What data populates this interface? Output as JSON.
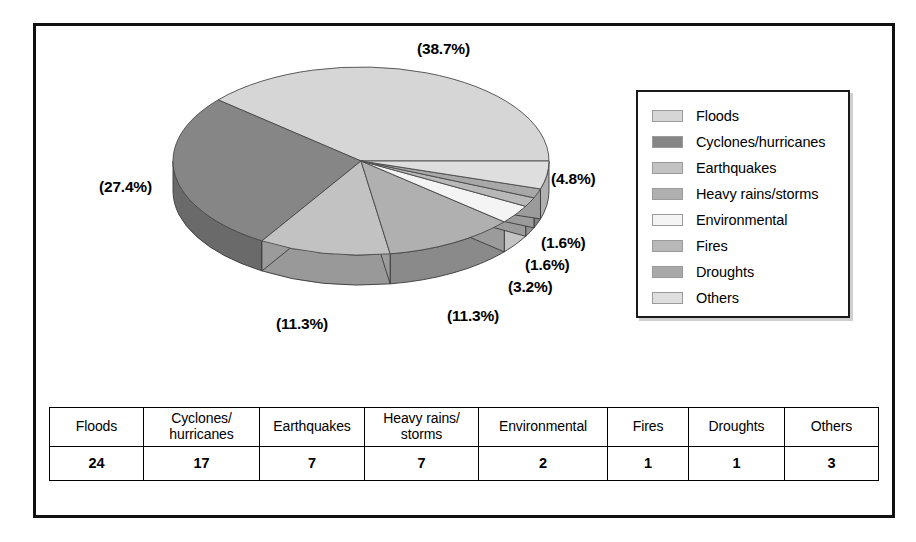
{
  "chart_data": {
    "type": "pie",
    "title": "",
    "subtitle": "",
    "xlabel": "",
    "ylabel": "",
    "legend_position": "right",
    "grid": false,
    "three_d": true,
    "total": 62,
    "categories": [
      "Floods",
      "Cyclones/hurricanes",
      "Earthquakes",
      "Heavy rains/storms",
      "Environmental",
      "Fires",
      "Droughts",
      "Others"
    ],
    "values": [
      24,
      17,
      7,
      7,
      2,
      1,
      1,
      3
    ],
    "percentages": [
      38.7,
      27.4,
      11.3,
      11.3,
      3.2,
      1.6,
      1.6,
      4.8
    ],
    "percent_labels": [
      "(38.7%)",
      "(27.4%)",
      "(11.3%)",
      "(11.3%)",
      "(3.2%)",
      "(1.6%)",
      "(1.6%)",
      "(4.8%)"
    ],
    "colors": [
      "#d6d6d6",
      "#868686",
      "#c2c2c2",
      "#b0b0b0",
      "#f4f4f4",
      "#b8b8b8",
      "#a8a8a8",
      "#dedede"
    ],
    "side_colors": [
      "#a8a8a8",
      "#6a6a6a",
      "#999999",
      "#8a8a8a",
      "#c4c4c4",
      "#909090",
      "#828282",
      "#b0b0b0"
    ]
  },
  "legend": {
    "items": [
      {
        "label": "Floods"
      },
      {
        "label": "Cyclones/hurricanes"
      },
      {
        "label": "Earthquakes"
      },
      {
        "label": "Heavy rains/storms"
      },
      {
        "label": "Environmental"
      },
      {
        "label": "Fires"
      },
      {
        "label": "Droughts"
      },
      {
        "label": "Others"
      }
    ]
  },
  "pie_labels": [
    {
      "text": "(38.7%)",
      "x": 381,
      "y": 14
    },
    {
      "text": "(27.4%)",
      "x": 63,
      "y": 152
    },
    {
      "text": "(4.8%)",
      "x": 515,
      "y": 144
    },
    {
      "text": "(1.6%)",
      "x": 505,
      "y": 208
    },
    {
      "text": "(1.6%)",
      "x": 489,
      "y": 230
    },
    {
      "text": "(3.2%)",
      "x": 472,
      "y": 252
    },
    {
      "text": "(11.3%)",
      "x": 411,
      "y": 281
    },
    {
      "text": "(11.3%)",
      "x": 240,
      "y": 289
    }
  ],
  "table": {
    "headers": [
      "Floods",
      "Cyclones/\nhurricanes",
      "Earthquakes",
      "Heavy rains/\nstorms",
      "Environmental",
      "Fires",
      "Droughts",
      "Others"
    ],
    "values": [
      "24",
      "17",
      "7",
      "7",
      "2",
      "1",
      "1",
      "3"
    ],
    "col_widths": [
      93,
      115,
      104,
      113,
      128,
      80,
      95,
      93
    ]
  }
}
